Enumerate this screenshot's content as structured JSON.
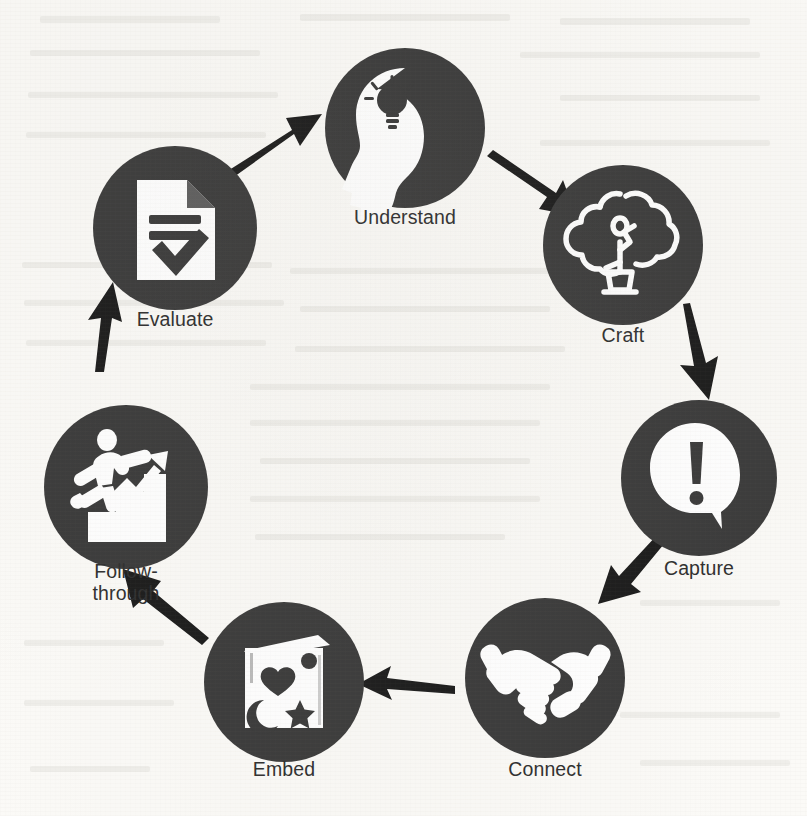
{
  "diagram": {
    "type": "cycle",
    "direction": "clockwise",
    "colors": {
      "node_fill": "#3b3b3b",
      "icon": "#ffffff",
      "arrow": "#1c1c1c",
      "label_text": "#2f2f2f",
      "background": "#fbfaf7"
    },
    "nodes": [
      {
        "id": "understand",
        "label": "Understand",
        "icon": "head-lightbulb-icon",
        "order": 1,
        "cx": 405,
        "cy": 128,
        "r": 80
      },
      {
        "id": "craft",
        "label": "Craft",
        "icon": "topiary-tree-icon",
        "order": 2,
        "cx": 623,
        "cy": 245,
        "r": 80
      },
      {
        "id": "capture",
        "label": "Capture",
        "icon": "speech-bubble-alert-icon",
        "order": 3,
        "cx": 699,
        "cy": 478,
        "r": 78
      },
      {
        "id": "connect",
        "label": "Connect",
        "icon": "handshake-icon",
        "order": 4,
        "cx": 545,
        "cy": 678,
        "r": 80
      },
      {
        "id": "embed",
        "label": "Embed",
        "icon": "book-shapes-icon",
        "order": 5,
        "cx": 284,
        "cy": 682,
        "r": 80
      },
      {
        "id": "follow-through",
        "label": "Follow-\nthrough",
        "icon": "stairs-climb-chart-icon",
        "order": 6,
        "cx": 126,
        "cy": 487,
        "r": 82
      },
      {
        "id": "evaluate",
        "label": "Evaluate",
        "icon": "document-check-icon",
        "order": 7,
        "cx": 175,
        "cy": 228,
        "r": 82
      }
    ],
    "arrows": [
      {
        "id": "evaluate-to-understand",
        "from": "evaluate",
        "to": "understand"
      },
      {
        "id": "understand-to-craft",
        "from": "understand",
        "to": "craft"
      },
      {
        "id": "craft-to-capture",
        "from": "craft",
        "to": "capture"
      },
      {
        "id": "capture-to-connect",
        "from": "capture",
        "to": "connect"
      },
      {
        "id": "connect-to-embed",
        "from": "connect",
        "to": "embed"
      },
      {
        "id": "embed-to-follow-through",
        "from": "embed",
        "to": "follow-through"
      },
      {
        "id": "follow-through-to-evaluate",
        "from": "follow-through",
        "to": "evaluate"
      }
    ]
  }
}
